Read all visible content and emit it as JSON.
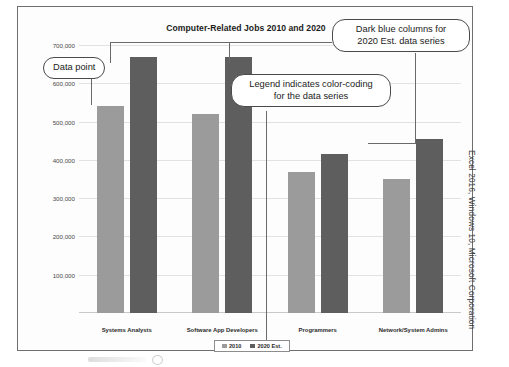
{
  "figure": {
    "side_caption": "Excel 2016, Windows 10, Microsoft Corporation"
  },
  "chart_data": {
    "type": "bar",
    "title": "Computer-Related Jobs 2010 and 2020",
    "xlabel": "",
    "ylabel": "",
    "ylim": [
      0,
      700000
    ],
    "yticks": [
      "100,000",
      "200,000",
      "300,000",
      "400,000",
      "500,000",
      "600,000",
      "700,000"
    ],
    "ytick_values": [
      100000,
      200000,
      300000,
      400000,
      500000,
      600000,
      700000
    ],
    "grid": true,
    "legend_position": "bottom",
    "categories": [
      "Systems Analysts",
      "Software App Developers",
      "Programmers",
      "Network/System Admins"
    ],
    "series": [
      {
        "name": "2010",
        "color": "#9b9b9b",
        "values": [
          540000,
          520000,
          368000,
          350000
        ]
      },
      {
        "name": "2020 Est.",
        "color": "#5e5e5e",
        "values": [
          670000,
          670000,
          415000,
          455000
        ]
      }
    ]
  },
  "annotations": [
    {
      "id": "data-point",
      "text": "Data point"
    },
    {
      "id": "dark-blue-columns",
      "line1": "Dark blue columns for",
      "line2": "2020 Est. data series"
    },
    {
      "id": "legend-note",
      "line1": "Legend indicates color-coding",
      "line2": "for the data series"
    }
  ]
}
